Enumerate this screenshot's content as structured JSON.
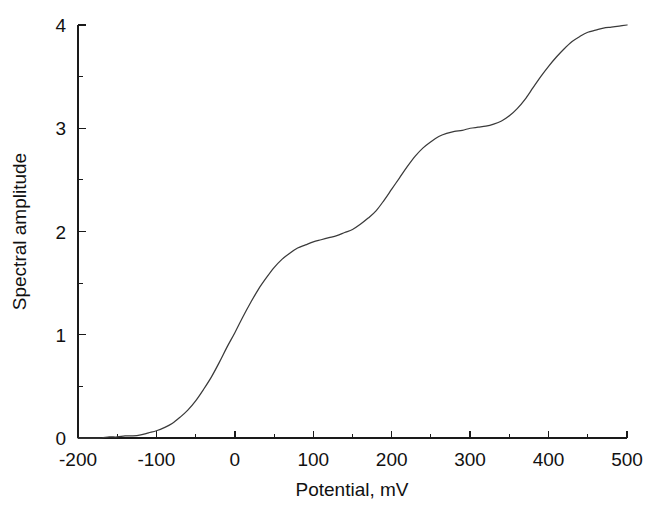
{
  "figure": {
    "background_color": "#ffffff",
    "curve_color": "#3a3a3a",
    "axis_color": "#1a1a1a",
    "text_color": "#111111"
  },
  "axes": {
    "x_title": "Potential, mV",
    "y_title": "Spectral amplitude",
    "x_tick_labels": [
      "-200",
      "-100",
      "0",
      "100",
      "200",
      "300",
      "400",
      "500"
    ],
    "y_tick_labels": [
      "0",
      "1",
      "2",
      "3",
      "4"
    ]
  },
  "chart_data": {
    "type": "line",
    "title": "",
    "subtitle": "",
    "xlabel": "Potential, mV",
    "ylabel": "Spectral amplitude",
    "xlim": [
      -200,
      500
    ],
    "ylim": [
      0,
      4
    ],
    "xticks": [
      -200,
      -100,
      0,
      100,
      200,
      300,
      400,
      500
    ],
    "xticks_minor": [
      -150,
      -50,
      50,
      150,
      250,
      350,
      450
    ],
    "yticks": [
      0,
      1,
      2,
      3,
      4
    ],
    "yticks_minor": [
      0.5,
      1.5,
      2.5,
      3.5
    ],
    "grid": false,
    "legend": null,
    "legend_position": "none",
    "annotations": [],
    "series": [
      {
        "name": "Spectral amplitude vs potential",
        "x": [
          -200,
          -190,
          -180,
          -170,
          -160,
          -150,
          -140,
          -130,
          -120,
          -110,
          -100,
          -90,
          -80,
          -70,
          -60,
          -50,
          -40,
          -30,
          -20,
          -10,
          0,
          10,
          20,
          30,
          40,
          50,
          60,
          70,
          80,
          90,
          100,
          110,
          120,
          130,
          140,
          150,
          160,
          170,
          180,
          190,
          200,
          210,
          220,
          230,
          240,
          250,
          260,
          270,
          280,
          290,
          300,
          310,
          320,
          330,
          340,
          350,
          360,
          370,
          380,
          390,
          400,
          410,
          420,
          430,
          440,
          450,
          460,
          470,
          480,
          490,
          500
        ],
        "y": [
          0.0,
          0.0,
          0.0,
          0.0,
          0.01,
          0.01,
          0.02,
          0.02,
          0.03,
          0.05,
          0.07,
          0.1,
          0.14,
          0.2,
          0.27,
          0.36,
          0.47,
          0.59,
          0.73,
          0.88,
          1.02,
          1.17,
          1.31,
          1.44,
          1.55,
          1.65,
          1.73,
          1.79,
          1.84,
          1.87,
          1.9,
          1.92,
          1.94,
          1.96,
          1.99,
          2.02,
          2.07,
          2.13,
          2.2,
          2.3,
          2.41,
          2.52,
          2.63,
          2.73,
          2.81,
          2.87,
          2.92,
          2.95,
          2.97,
          2.98,
          3.0,
          3.01,
          3.02,
          3.04,
          3.07,
          3.12,
          3.19,
          3.28,
          3.39,
          3.5,
          3.6,
          3.69,
          3.77,
          3.84,
          3.89,
          3.93,
          3.95,
          3.97,
          3.98,
          3.99,
          4.0
        ]
      }
    ]
  }
}
